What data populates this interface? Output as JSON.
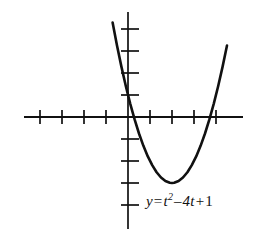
{
  "figure": {
    "equation_label": {
      "lhs": "y",
      "equals": "=",
      "base_var": "t",
      "exponent": "2",
      "minus": "–",
      "coefficient_term": "4t",
      "plus": "+",
      "constant": "1",
      "full_text": "y = t² – 4t + 1"
    },
    "colors": {
      "ink": "#111111",
      "axis": "#111111",
      "curve": "#111111",
      "background": "#ffffff"
    }
  },
  "chart_data": {
    "type": "line",
    "title": "",
    "subtitle": "",
    "xlabel": "t",
    "ylabel": "y",
    "annotations": [
      "y = t² – 4t + 1"
    ],
    "legend": [],
    "legend_position": "none",
    "grid": false,
    "axis_style": "cartesian-cross",
    "equation": "y = t^2 - 4t + 1",
    "xlim": [
      -4.7,
      5.2
    ],
    "ylim": [
      -5.0,
      5.0
    ],
    "x_ticks": [
      -4,
      -3,
      -2,
      -1,
      1,
      2,
      3,
      4
    ],
    "y_ticks": [
      -5,
      -4,
      -3,
      -2,
      -1,
      1,
      2,
      3,
      4
    ],
    "tick_labels_shown": false,
    "vertex": [
      2,
      -3
    ],
    "roots": [
      0.268,
      3.732
    ],
    "y_intercept": 1,
    "x": [
      -0.9,
      -0.7,
      -0.5,
      -0.3,
      -0.1,
      0.1,
      0.3,
      0.5,
      0.7,
      0.9,
      1.1,
      1.3,
      1.5,
      1.7,
      1.9,
      2.0,
      2.1,
      2.3,
      2.5,
      2.7,
      2.9,
      3.1,
      3.3,
      3.5,
      3.7,
      3.9,
      4.1,
      4.3,
      4.5
    ],
    "y": [
      5.41,
      4.29,
      3.25,
      2.29,
      1.41,
      0.61,
      -0.11,
      -0.75,
      -1.31,
      -1.79,
      -2.19,
      -2.51,
      -2.75,
      -2.91,
      -2.99,
      -3.0,
      -2.99,
      -2.91,
      -2.75,
      -2.51,
      -2.19,
      -1.79,
      -1.31,
      -0.75,
      -0.11,
      0.61,
      1.41,
      2.29,
      3.25
    ],
    "series": [
      {
        "name": "y = t² – 4t + 1",
        "x": [
          -0.9,
          -0.7,
          -0.5,
          -0.3,
          -0.1,
          0.1,
          0.3,
          0.5,
          0.7,
          0.9,
          1.1,
          1.3,
          1.5,
          1.7,
          1.9,
          2.0,
          2.1,
          2.3,
          2.5,
          2.7,
          2.9,
          3.1,
          3.3,
          3.5,
          3.7,
          3.9,
          4.1,
          4.3,
          4.5
        ],
        "values": [
          5.41,
          4.29,
          3.25,
          2.29,
          1.41,
          0.61,
          -0.11,
          -0.75,
          -1.31,
          -1.79,
          -2.19,
          -2.51,
          -2.75,
          -2.91,
          -2.99,
          -3.0,
          -2.99,
          -2.91,
          -2.75,
          -2.51,
          -2.19,
          -1.79,
          -1.31,
          -0.75,
          -0.11,
          0.61,
          1.41,
          2.29,
          3.25
        ]
      }
    ]
  }
}
